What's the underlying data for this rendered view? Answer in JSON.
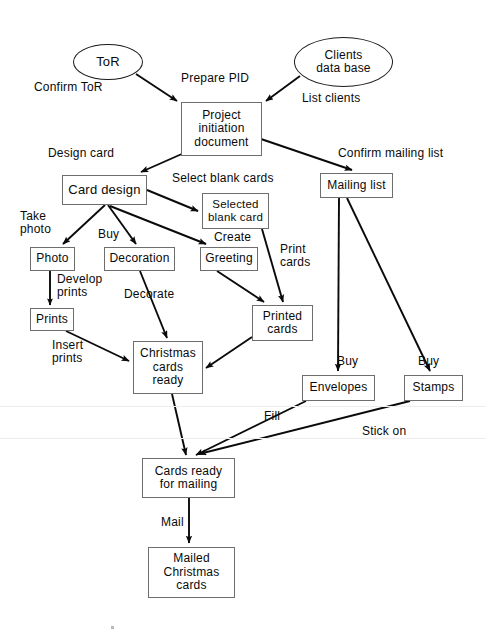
{
  "diagram": {
    "type": "flowchart",
    "colors": {
      "background": "#ffffff",
      "box_stroke": "#6e6e6e",
      "ellipse_stroke": "#1a1a1a",
      "arrow": "#0a0a0a",
      "text": "#0a0a0a"
    },
    "nodes": [
      {
        "id": "tor",
        "shape": "ellipse",
        "label": "ToR",
        "x": 73,
        "y": 44,
        "w": 70,
        "h": 36,
        "font": 13
      },
      {
        "id": "clients_db",
        "shape": "ellipse",
        "label": "Clients\ndata base",
        "x": 294,
        "y": 37,
        "w": 99,
        "h": 50,
        "font": 12
      },
      {
        "id": "pid",
        "shape": "box",
        "label": "Project\ninitiation\ndocument",
        "x": 181,
        "y": 102,
        "w": 81,
        "h": 54,
        "font": 12
      },
      {
        "id": "card_design",
        "shape": "box",
        "label": "Card  design",
        "x": 62,
        "y": 175,
        "w": 85,
        "h": 30,
        "font": 13
      },
      {
        "id": "mailing_list",
        "shape": "box",
        "label": "Mailing  list",
        "x": 320,
        "y": 173,
        "w": 73,
        "h": 25,
        "font": 12
      },
      {
        "id": "selected_blank",
        "shape": "box",
        "label": "Selected\nblank  card",
        "x": 202,
        "y": 193,
        "w": 67,
        "h": 36,
        "font": 11.5
      },
      {
        "id": "photo",
        "shape": "box",
        "label": "Photo",
        "x": 30,
        "y": 247,
        "w": 45,
        "h": 24,
        "font": 12
      },
      {
        "id": "decoration",
        "shape": "box",
        "label": "Decoration",
        "x": 104,
        "y": 247,
        "w": 71,
        "h": 24,
        "font": 12
      },
      {
        "id": "greeting",
        "shape": "box",
        "label": "Greeting",
        "x": 200,
        "y": 247,
        "w": 58,
        "h": 24,
        "font": 12
      },
      {
        "id": "prints",
        "shape": "box",
        "label": "Prints",
        "x": 30,
        "y": 308,
        "w": 44,
        "h": 23,
        "font": 12
      },
      {
        "id": "printed_cards",
        "shape": "box",
        "label": "Printed\ncards",
        "x": 252,
        "y": 305,
        "w": 61,
        "h": 36,
        "font": 12
      },
      {
        "id": "xmas_ready",
        "shape": "box",
        "label": "Christmas\ncards\nready",
        "x": 133,
        "y": 341,
        "w": 70,
        "h": 53,
        "font": 12
      },
      {
        "id": "envelopes",
        "shape": "box",
        "label": "Envelopes",
        "x": 302,
        "y": 375,
        "w": 73,
        "h": 26,
        "font": 12
      },
      {
        "id": "stamps",
        "shape": "box",
        "label": "Stamps",
        "x": 404,
        "y": 375,
        "w": 59,
        "h": 26,
        "font": 12
      },
      {
        "id": "cards_ready",
        "shape": "box",
        "label": "Cards  ready\nfor  mailing",
        "x": 142,
        "y": 458,
        "w": 93,
        "h": 40,
        "font": 12
      },
      {
        "id": "mailed",
        "shape": "box",
        "label": "Mailed\nChristmas\ncards",
        "x": 148,
        "y": 547,
        "w": 87,
        "h": 51,
        "font": 12
      }
    ],
    "edge_labels": [
      {
        "id": "confirm_tor",
        "text": "Confirm  ToR",
        "x": 34,
        "y": 81,
        "font": 12
      },
      {
        "id": "prepare_pid",
        "text": "Prepare  PID",
        "x": 181,
        "y": 72,
        "font": 12
      },
      {
        "id": "list_clients",
        "text": "List  clients",
        "x": 302,
        "y": 92,
        "font": 12
      },
      {
        "id": "design_card",
        "text": "Design  card",
        "x": 48,
        "y": 147,
        "font": 12
      },
      {
        "id": "confirm_mailing_list",
        "text": "Confirm  mailing  list",
        "x": 338,
        "y": 147,
        "font": 12
      },
      {
        "id": "select_blank_cards",
        "text": "Select  blank  cards",
        "x": 172,
        "y": 172,
        "font": 12
      },
      {
        "id": "take_photo",
        "text": "Take\nphoto",
        "x": 20,
        "y": 210,
        "font": 12
      },
      {
        "id": "buy_decoration",
        "text": "Buy",
        "x": 98,
        "y": 228,
        "font": 12
      },
      {
        "id": "create_greeting",
        "text": "Create",
        "x": 214,
        "y": 231,
        "font": 12
      },
      {
        "id": "print_cards",
        "text": "Print\ncards",
        "x": 280,
        "y": 243,
        "font": 12
      },
      {
        "id": "develop_prints",
        "text": "Develop\nprints",
        "x": 57,
        "y": 273,
        "font": 12
      },
      {
        "id": "decorate",
        "text": "Decorate",
        "x": 124,
        "y": 288,
        "font": 12
      },
      {
        "id": "insert_prints",
        "text": "Insert\nprints",
        "x": 52,
        "y": 339,
        "font": 12
      },
      {
        "id": "buy_envelopes",
        "text": "Buy",
        "x": 337,
        "y": 355,
        "font": 12
      },
      {
        "id": "buy_stamps",
        "text": "Buy",
        "x": 418,
        "y": 355,
        "font": 12
      },
      {
        "id": "fill",
        "text": "Fill",
        "x": 264,
        "y": 410,
        "font": 12
      },
      {
        "id": "stick_on",
        "text": "Stick  on",
        "x": 362,
        "y": 425,
        "font": 12
      },
      {
        "id": "mail",
        "text": "Mail",
        "x": 161,
        "y": 516,
        "font": 12
      }
    ],
    "edges": [
      {
        "id": "tor-to-pid",
        "from": "tor",
        "to": "pid",
        "label": "Confirm  ToR"
      },
      {
        "id": "clients-db-to-pid",
        "from": "clients_db",
        "to": "pid",
        "label": "List  clients"
      },
      {
        "id": "pid-to-card-design",
        "from": "pid",
        "to": "card_design",
        "label": "Design  card"
      },
      {
        "id": "pid-to-mailing-list",
        "from": "pid",
        "to": "mailing_list",
        "label": "Confirm  mailing  list"
      },
      {
        "id": "card-design-to-selected-blank",
        "from": "card_design",
        "to": "selected_blank",
        "label": "Select  blank  cards"
      },
      {
        "id": "card-design-to-photo",
        "from": "card_design",
        "to": "photo",
        "label": "Take  photo"
      },
      {
        "id": "card-design-to-decoration",
        "from": "card_design",
        "to": "decoration",
        "label": "Buy"
      },
      {
        "id": "card-design-to-greeting",
        "from": "card_design",
        "to": "greeting",
        "label": "Create"
      },
      {
        "id": "photo-to-prints",
        "from": "photo",
        "to": "prints",
        "label": "Develop  prints"
      },
      {
        "id": "prints-to-xmas-ready",
        "from": "prints",
        "to": "xmas_ready",
        "label": "Insert  prints"
      },
      {
        "id": "decoration-to-xmas-ready",
        "from": "decoration",
        "to": "xmas_ready",
        "label": "Decorate"
      },
      {
        "id": "greeting-to-printed-cards",
        "from": "greeting",
        "to": "printed_cards",
        "label": ""
      },
      {
        "id": "selected-blank-to-printed-cards",
        "from": "selected_blank",
        "to": "printed_cards",
        "label": "Print  cards"
      },
      {
        "id": "printed-cards-to-xmas-ready",
        "from": "printed_cards",
        "to": "xmas_ready",
        "label": ""
      },
      {
        "id": "mailing-list-to-envelopes",
        "from": "mailing_list",
        "to": "envelopes",
        "label": "Buy"
      },
      {
        "id": "mailing-list-to-stamps",
        "from": "mailing_list",
        "to": "stamps",
        "label": "Buy"
      },
      {
        "id": "xmas-ready-to-cards-ready",
        "from": "xmas_ready",
        "to": "cards_ready",
        "label": ""
      },
      {
        "id": "envelopes-to-cards-ready",
        "from": "envelopes",
        "to": "cards_ready",
        "label": "Fill"
      },
      {
        "id": "stamps-to-cards-ready",
        "from": "stamps",
        "to": "cards_ready",
        "label": "Stick  on"
      },
      {
        "id": "cards-ready-to-mailed",
        "from": "cards_ready",
        "to": "mailed",
        "label": "Mail"
      }
    ]
  }
}
